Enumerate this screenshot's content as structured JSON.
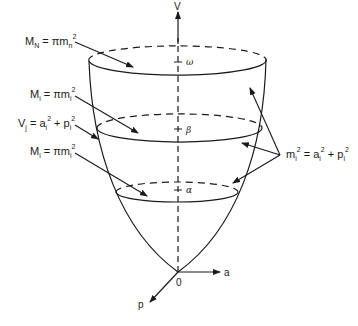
{
  "diagram": {
    "axes": {
      "vertical": "V",
      "horizontal": "a",
      "depth": "p",
      "origin": "0"
    },
    "levels": {
      "top": "ω",
      "middle": "β",
      "bottom": "α"
    },
    "left_labels": {
      "top": {
        "lhs_main": "M",
        "lhs_sub": "N",
        "eq": " = πm",
        "rhs_sub": "n",
        "rhs_sup": "2"
      },
      "second": {
        "lhs_main": "M",
        "lhs_sub": "i",
        "eq": " = πm",
        "rhs_sub": "i",
        "rhs_sup": "2"
      },
      "third": {
        "lhs_main": "V",
        "lhs_sub": "j",
        "eq": " = a",
        "a_sub": "i",
        "a_sup": "2",
        "plus": " + p",
        "p_sub": "i",
        "p_sup": "2"
      },
      "fourth": {
        "lhs_main": "M",
        "lhs_sub": "i",
        "eq": " = πm",
        "rhs_sub": "i",
        "rhs_sup": "2"
      }
    },
    "right_label": {
      "m": "m",
      "m_sub": "i",
      "m_sup": "2",
      "eq": " = a",
      "a_sub": "i",
      "a_sup": "2",
      "plus": " + p",
      "p_sub": "i",
      "p_sup": "2"
    },
    "colors": {
      "stroke": "#1a1a1a",
      "background": "#ffffff"
    }
  }
}
